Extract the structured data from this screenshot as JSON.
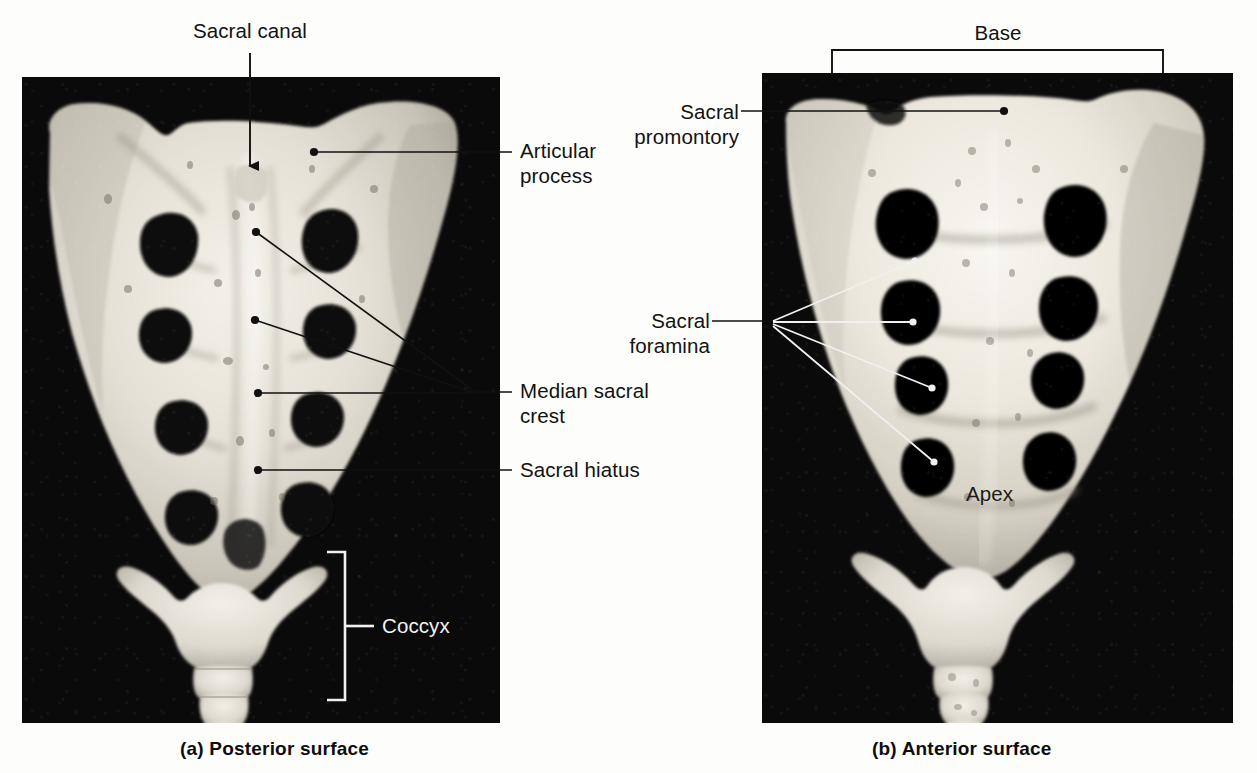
{
  "figure": {
    "background_color": "#fdfdfb",
    "plate_background_color": "#0a0a0a",
    "bone_color": "#e9e6de",
    "leader_line_color_light": "#e8e8e8",
    "leader_line_color_dark": "#111111"
  },
  "panel_a": {
    "caption": "(a) Posterior surface",
    "labels": {
      "sacral_canal": "Sacral canal",
      "articular_process": "Articular\nprocess",
      "median_sacral_crest": "Median sacral\ncrest",
      "sacral_hiatus": "Sacral hiatus",
      "coccyx": "Coccyx"
    }
  },
  "panel_b": {
    "caption": "(b) Anterior surface",
    "labels": {
      "base": "Base",
      "sacral_promontory": "Sacral\npromontory",
      "sacral_foramina": "Sacral\nforamina",
      "apex": "Apex"
    }
  }
}
